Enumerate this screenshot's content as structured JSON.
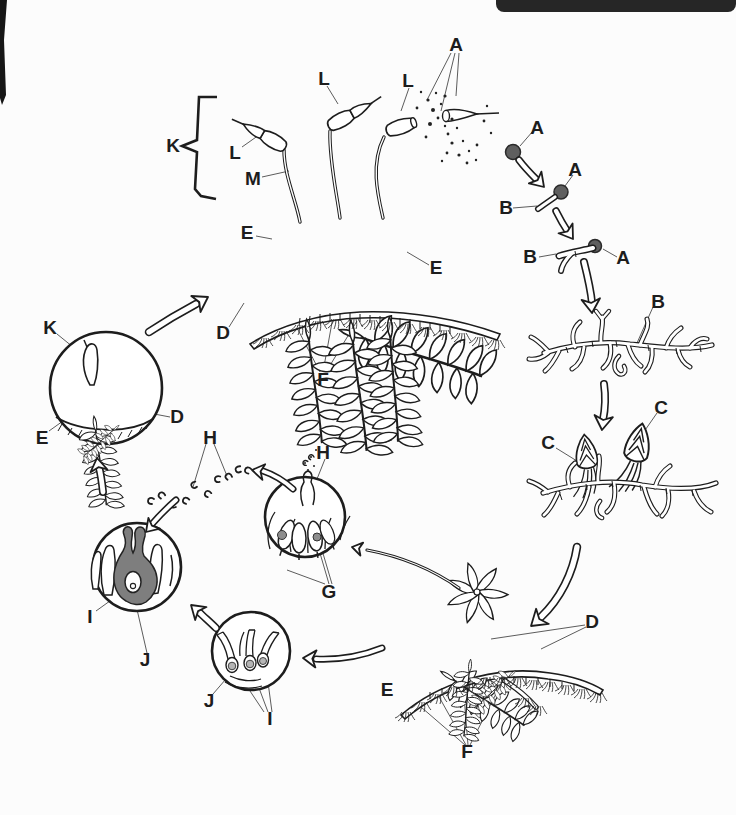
{
  "figure": {
    "kind": "moss-life-cycle-diagram",
    "colors": {
      "ink": "#1d1d1d",
      "spore_fill": "#5f5f5f",
      "egg_fill": "#b5b5b5",
      "shaded_archegonium": "#7e7e7e",
      "header_bar": "#262626",
      "paper": "#fcfcfc"
    }
  },
  "labels": [
    {
      "id": "spores-released",
      "text": "A"
    },
    {
      "id": "capsule-left",
      "text": "L"
    },
    {
      "id": "capsule-middle",
      "text": "L"
    },
    {
      "id": "capsule-right",
      "text": "L"
    },
    {
      "id": "seta",
      "text": "M"
    },
    {
      "id": "sporophyte-bracket",
      "text": "K"
    },
    {
      "id": "leafy-shoot-left",
      "text": "E"
    },
    {
      "id": "leafy-shoot-right",
      "text": "E"
    },
    {
      "id": "young-shoot",
      "text": "D"
    },
    {
      "id": "rhizoids-main",
      "text": "F"
    },
    {
      "id": "spore",
      "text": "A"
    },
    {
      "id": "germinating-spore-1-a",
      "text": "A"
    },
    {
      "id": "germinating-spore-1-b",
      "text": "B"
    },
    {
      "id": "germinating-spore-2-b",
      "text": "B"
    },
    {
      "id": "germinating-spore-2-a",
      "text": "A"
    },
    {
      "id": "protonema",
      "text": "B"
    },
    {
      "id": "bud-right",
      "text": "C"
    },
    {
      "id": "bud-left",
      "text": "C"
    },
    {
      "id": "gametophyte-shoots",
      "text": "D"
    },
    {
      "id": "gametophyte-leafy",
      "text": "E"
    },
    {
      "id": "gametophyte-rhizoids",
      "text": "F"
    },
    {
      "id": "antheridia",
      "text": "G"
    },
    {
      "id": "sperm-swarm",
      "text": "H"
    },
    {
      "id": "sperm-released",
      "text": "H"
    },
    {
      "id": "fertilization-i",
      "text": "I"
    },
    {
      "id": "fertilization-j",
      "text": "J"
    },
    {
      "id": "archegonia-j",
      "text": "J"
    },
    {
      "id": "eggs-i",
      "text": "I"
    },
    {
      "id": "young-sporophyte",
      "text": "K"
    },
    {
      "id": "circle-shoot-d",
      "text": "D"
    },
    {
      "id": "circle-shoot-e",
      "text": "E"
    }
  ]
}
